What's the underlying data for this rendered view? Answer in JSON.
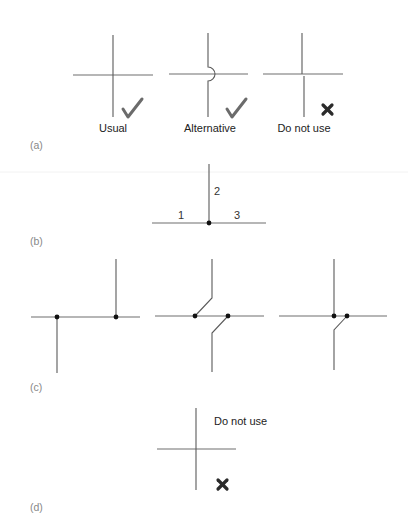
{
  "figure": {
    "panel_a": {
      "label": "(a)",
      "items": [
        {
          "caption": "Usual",
          "status": "check",
          "status_icon": "checkmark-icon"
        },
        {
          "caption": "Alternative",
          "status": "check",
          "status_icon": "checkmark-icon"
        },
        {
          "caption": "Do not use",
          "status": "cross",
          "status_icon": "cross-icon"
        }
      ]
    },
    "panel_b": {
      "label": "(b)",
      "branch_labels": [
        "1",
        "2",
        "3"
      ]
    },
    "panel_c": {
      "label": "(c)"
    },
    "panel_d": {
      "label": "(d)",
      "caption": "Do not use",
      "status": "cross",
      "status_icon": "cross-icon"
    },
    "colors": {
      "wire": "#5a5a5a",
      "junction_dot": "#111111",
      "check": "#6b6b6b",
      "cross": "#2b2b2b",
      "panel_label": "#888888"
    }
  }
}
